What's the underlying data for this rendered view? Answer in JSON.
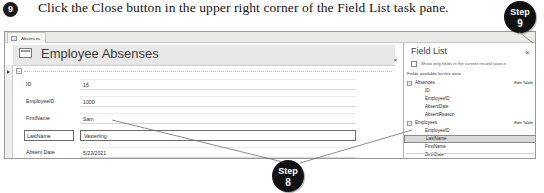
{
  "instruction": {
    "step_number": "9",
    "text": "Click the Close button in the upper right corner of the Field List task pane."
  },
  "callouts": [
    {
      "id": "step9",
      "label": "Step",
      "number": "9"
    },
    {
      "id": "step8",
      "label": "Step",
      "number": "8"
    }
  ],
  "screenshot": {
    "document_tab": {
      "label": "Absences",
      "icon": "form-icon"
    },
    "form": {
      "title": "Employee Absenses",
      "title_icon": "form-view-icon",
      "close_label": "×",
      "collapse_label": "−",
      "fields": [
        {
          "label": "ID",
          "value": "15",
          "selected": false
        },
        {
          "label": "EmployeeID",
          "value": "1000",
          "selected": false
        },
        {
          "label": "FirstName",
          "value": "Sam",
          "selected": false
        },
        {
          "label": "LastName",
          "value": "Vasterling",
          "selected": true
        },
        {
          "label": "Absent Date",
          "value": "5/23/2021",
          "selected": false
        }
      ]
    },
    "field_list_pane": {
      "title": "Field List",
      "close_label": "×",
      "toggle_icon": "show-fields-icon",
      "toggle_text": "Show only fields in the current record source",
      "subtitle": "Fields available for this view:",
      "edit_table_label": "Edit Table",
      "tables": [
        {
          "name": "Absences",
          "expander": "−",
          "fields": [
            {
              "name": "ID",
              "highlighted": false
            },
            {
              "name": "EmployeeID",
              "highlighted": false
            },
            {
              "name": "AbsentDate",
              "highlighted": false
            },
            {
              "name": "AbsentReason",
              "highlighted": false
            }
          ]
        },
        {
          "name": "Employees",
          "expander": "−",
          "fields": [
            {
              "name": "EmployeeID",
              "highlighted": false
            },
            {
              "name": "LastName",
              "highlighted": true
            },
            {
              "name": "FirstName",
              "highlighted": false
            },
            {
              "name": "BirthDate",
              "highlighted": false
            }
          ]
        }
      ]
    }
  },
  "colors": {
    "badge": "#111111",
    "accent_border": "#6b6b6b",
    "highlight": "#d9d9d9"
  }
}
